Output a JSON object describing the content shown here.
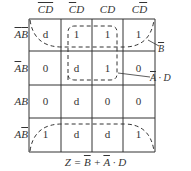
{
  "kmap": {
    "columns": [
      {
        "label": "CD",
        "overline": "CD"
      },
      {
        "label": "CD",
        "overline": "C"
      },
      {
        "label": "CD",
        "overline": ""
      },
      {
        "label": "CD",
        "overline": "D"
      }
    ],
    "rows": [
      {
        "label": "AB",
        "overline": "AB",
        "cells": [
          "d",
          "1",
          "1",
          "1"
        ]
      },
      {
        "label": "AB",
        "overline": "A",
        "cells": [
          "0",
          "d",
          "1",
          "0"
        ]
      },
      {
        "label": "AB",
        "overline": "",
        "cells": [
          "0",
          "d",
          "0",
          "0"
        ]
      },
      {
        "label": "AB",
        "overline": "B",
        "cells": [
          "1",
          "d",
          "d",
          "1"
        ]
      }
    ]
  },
  "groups": [
    {
      "label_main": "B",
      "overline": true,
      "style": "dashed"
    },
    {
      "label_main": "A · D",
      "overline_part": "A",
      "style": "dashed"
    }
  ],
  "formula": {
    "lhs": "Z =",
    "term1": "B",
    "plus": "+",
    "term2a": "A",
    "term2b": "· D"
  },
  "colors": {
    "line": "#333333",
    "background": "#ffffff"
  }
}
